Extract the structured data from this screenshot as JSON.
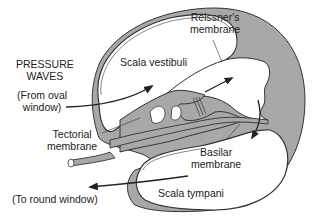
{
  "diagram": {
    "colors": {
      "tissue_fill": "#a8a8a8",
      "outline": "#333333",
      "background": "#ffffff",
      "text": "#222222"
    },
    "labels": {
      "pressure_waves": [
        "PRESSURE",
        "WAVES"
      ],
      "from_oval": [
        "(From oval",
        "window)"
      ],
      "reissner": [
        "Reissner's",
        "membrane"
      ],
      "scala_vestibuli": "Scala vestibuli",
      "tectorial": [
        "Tectorial",
        "membrane"
      ],
      "basilar": [
        "Basilar",
        "membrane"
      ],
      "scala_tympani": "Scala tympani",
      "to_round": "(To round window)"
    },
    "arrows": [
      {
        "name": "from-oval-window-arrow",
        "direction": "into scala vestibuli"
      },
      {
        "name": "tectorial-up-arrow",
        "direction": "up-right through cochlear duct"
      },
      {
        "name": "basilar-down-arrow",
        "direction": "down into scala tympani"
      },
      {
        "name": "to-round-window-arrow",
        "direction": "out left toward round window"
      }
    ]
  }
}
